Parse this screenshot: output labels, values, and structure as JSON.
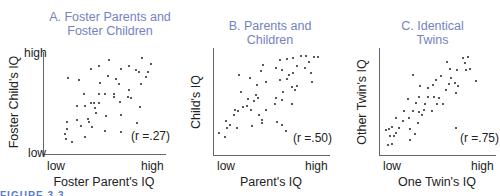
{
  "figure_label": "FIGURE 3.3",
  "chart_data": [
    {
      "type": "scatter",
      "title": "A. Foster Parents and\nFoster Children",
      "xlabel": "Foster Parent's IQ",
      "ylabel": "Foster Child's IQ",
      "x_ticks": [
        "low",
        "high"
      ],
      "y_ticks": [
        "high",
        "low"
      ],
      "annotation": "(r =.27)",
      "r": 0.27,
      "plot_px": {
        "left": 43,
        "top": 52,
        "width": 122,
        "height": 102
      },
      "points_px": [
        [
          109,
          60
        ],
        [
          142,
          58
        ],
        [
          91,
          69
        ],
        [
          99,
          66
        ],
        [
          68,
          78
        ],
        [
          79,
          80
        ],
        [
          108,
          76
        ],
        [
          121,
          69
        ],
        [
          129,
          66
        ],
        [
          136,
          70
        ],
        [
          139,
          72
        ],
        [
          151,
          64
        ],
        [
          148,
          72
        ],
        [
          146,
          77
        ],
        [
          116,
          79
        ],
        [
          100,
          83
        ],
        [
          119,
          84
        ],
        [
          141,
          84
        ],
        [
          84,
          94
        ],
        [
          99,
          94
        ],
        [
          105,
          94
        ],
        [
          114,
          94
        ],
        [
          114,
          97
        ],
        [
          129,
          90
        ],
        [
          128,
          97
        ],
        [
          131,
          98
        ],
        [
          94,
          103
        ],
        [
          91,
          103
        ],
        [
          99,
          103
        ],
        [
          120,
          102
        ],
        [
          77,
          106
        ],
        [
          85,
          106
        ],
        [
          95,
          108
        ],
        [
          96,
          113
        ],
        [
          140,
          107
        ],
        [
          106,
          116
        ],
        [
          121,
          115
        ],
        [
          67,
          122
        ],
        [
          77,
          120
        ],
        [
          88,
          119
        ],
        [
          89,
          122
        ],
        [
          81,
          126
        ],
        [
          92,
          127
        ],
        [
          137,
          123
        ],
        [
          67,
          129
        ],
        [
          105,
          131
        ],
        [
          121,
          132
        ],
        [
          65,
          134
        ],
        [
          66,
          139
        ],
        [
          85,
          137
        ],
        [
          72,
          142
        ]
      ]
    },
    {
      "type": "scatter",
      "title": "B. Parents and\nChildren",
      "xlabel": "Parent's IQ",
      "ylabel": "Child's IQ",
      "x_ticks": [
        "low",
        "high"
      ],
      "y_ticks": [],
      "annotation": "(r =.50)",
      "r": 0.5,
      "plot_px": {
        "left": 213,
        "top": 48,
        "width": 116,
        "height": 107
      },
      "points_px": [
        [
          280,
          60
        ],
        [
          287,
          59
        ],
        [
          293,
          58
        ],
        [
          301,
          56
        ],
        [
          306,
          56
        ],
        [
          314,
          57
        ],
        [
          318,
          57
        ],
        [
          297,
          66
        ],
        [
          309,
          62
        ],
        [
          263,
          65
        ],
        [
          276,
          68
        ],
        [
          282,
          70
        ],
        [
          293,
          73
        ],
        [
          305,
          68
        ],
        [
          311,
          73
        ],
        [
          289,
          75
        ],
        [
          261,
          71
        ],
        [
          239,
          75
        ],
        [
          266,
          82
        ],
        [
          280,
          80
        ],
        [
          287,
          79
        ],
        [
          292,
          87
        ],
        [
          297,
          86
        ],
        [
          312,
          82
        ],
        [
          250,
          78
        ],
        [
          257,
          85
        ],
        [
          283,
          92
        ],
        [
          295,
          90
        ],
        [
          241,
          92
        ],
        [
          256,
          95
        ],
        [
          258,
          98
        ],
        [
          276,
          98
        ],
        [
          248,
          99
        ],
        [
          254,
          101
        ],
        [
          235,
          110
        ],
        [
          243,
          107
        ],
        [
          247,
          106
        ],
        [
          251,
          110
        ],
        [
          266,
          110
        ],
        [
          275,
          104
        ],
        [
          282,
          100
        ],
        [
          292,
          104
        ],
        [
          226,
          121
        ],
        [
          234,
          115
        ],
        [
          238,
          111
        ],
        [
          259,
          115
        ],
        [
          262,
          120
        ],
        [
          277,
          122
        ],
        [
          282,
          125
        ],
        [
          230,
          125
        ],
        [
          237,
          128
        ],
        [
          252,
          126
        ],
        [
          262,
          123
        ],
        [
          227,
          128
        ],
        [
          219,
          133
        ],
        [
          225,
          137
        ],
        [
          286,
          131
        ]
      ]
    },
    {
      "type": "scatter",
      "title": "C. Identical\nTwins",
      "xlabel": "One Twin's IQ",
      "ylabel": "Other Twin's IQ",
      "x_ticks": [
        "low",
        "high"
      ],
      "y_ticks": [],
      "annotation": "(r =.75)",
      "r": 0.75,
      "plot_px": {
        "left": 379,
        "top": 48,
        "width": 116,
        "height": 107
      },
      "points_px": [
        [
          463,
          58
        ],
        [
          468,
          57
        ],
        [
          447,
          62
        ],
        [
          465,
          63
        ],
        [
          450,
          69
        ],
        [
          457,
          70
        ],
        [
          466,
          70
        ],
        [
          470,
          69
        ],
        [
          413,
          75
        ],
        [
          441,
          76
        ],
        [
          476,
          81
        ],
        [
          451,
          78
        ],
        [
          436,
          80
        ],
        [
          449,
          84
        ],
        [
          455,
          83
        ],
        [
          458,
          86
        ],
        [
          420,
          86
        ],
        [
          428,
          88
        ],
        [
          433,
          85
        ],
        [
          446,
          90
        ],
        [
          456,
          93
        ],
        [
          419,
          97
        ],
        [
          428,
          97
        ],
        [
          434,
          97
        ],
        [
          439,
          98
        ],
        [
          408,
          99
        ],
        [
          416,
          103
        ],
        [
          425,
          104
        ],
        [
          437,
          104
        ],
        [
          443,
          104
        ],
        [
          424,
          110
        ],
        [
          404,
          111
        ],
        [
          413,
          111
        ],
        [
          419,
          112
        ],
        [
          432,
          111
        ],
        [
          409,
          118
        ],
        [
          422,
          115
        ],
        [
          396,
          118
        ],
        [
          403,
          121
        ],
        [
          418,
          123
        ],
        [
          392,
          127
        ],
        [
          399,
          128
        ],
        [
          410,
          129
        ],
        [
          396,
          133
        ],
        [
          415,
          134
        ],
        [
          386,
          130
        ],
        [
          389,
          129
        ],
        [
          390,
          136
        ],
        [
          394,
          136
        ],
        [
          410,
          140
        ],
        [
          456,
          128
        ],
        [
          388,
          145
        ],
        [
          392,
          144
        ]
      ]
    }
  ]
}
